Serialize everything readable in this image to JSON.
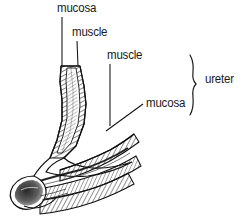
{
  "figure": {
    "style": {
      "background": "#ffffff",
      "ink": "#1a1a1a",
      "line_color": "#111111",
      "shading": "#555555"
    },
    "labels": [
      {
        "id": "mucosa-top",
        "text": "mucosa",
        "leader": "vertical"
      },
      {
        "id": "muscle-upper",
        "text": "muscle",
        "leader": "vertical"
      },
      {
        "id": "muscle-lower",
        "text": "muscle",
        "leader": "vertical"
      },
      {
        "id": "mucosa-lower",
        "text": "mucosa",
        "leader": "diagonal"
      },
      {
        "id": "ureter",
        "text": "ureter",
        "leader": "brace"
      }
    ],
    "structures": [
      {
        "name": "ureter-tube",
        "description": "obliquely descending ureter with hatched muscle wall"
      },
      {
        "name": "ureteral-orifice",
        "description": "bulbous stippled terminal opening at lower left"
      },
      {
        "name": "bladder-wall",
        "description": "layered bladder wall bands extending to lower right"
      }
    ]
  }
}
